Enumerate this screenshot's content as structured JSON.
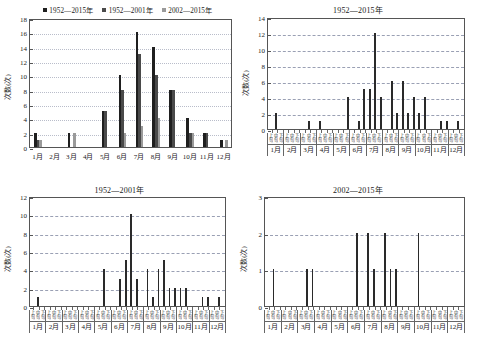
{
  "figure": {
    "ylabel": "次数(次)",
    "legend": [
      {
        "label": "1952—2015年",
        "color": "#1f1f1f"
      },
      {
        "label": "1952—2001年",
        "color": "#4a4a4a"
      },
      {
        "label": "2002—2015年",
        "color": "#9a9a9a"
      }
    ],
    "months": [
      "1月",
      "2月",
      "3月",
      "4月",
      "5月",
      "6月",
      "7月",
      "8月",
      "9月",
      "10月",
      "11月",
      "12月"
    ],
    "dekads": [
      "上旬",
      "中旬",
      "下旬"
    ]
  },
  "chart_data": [
    {
      "type": "bar",
      "panel": "top-left",
      "title": "",
      "xlabel": "",
      "ylabel": "次数(次)",
      "ylim": [
        0,
        18
      ],
      "yticks": [
        0,
        2,
        4,
        6,
        8,
        10,
        12,
        14,
        16,
        18
      ],
      "grid": true,
      "legend_position": "top-center",
      "categories": [
        "1月",
        "2月",
        "3月",
        "4月",
        "5月",
        "6月",
        "7月",
        "8月",
        "9月",
        "10月",
        "11月",
        "12月"
      ],
      "series": [
        {
          "name": "1952—2015年",
          "color": "#1f1f1f",
          "values": [
            2,
            0,
            2,
            0,
            5,
            10,
            16,
            14,
            8,
            4,
            2,
            1
          ]
        },
        {
          "name": "1952—2001年",
          "color": "#4a4a4a",
          "values": [
            1,
            0,
            0,
            0,
            5,
            8,
            13,
            10,
            8,
            2,
            2,
            0
          ]
        },
        {
          "name": "2002—2015年",
          "color": "#9a9a9a",
          "values": [
            1,
            0,
            2,
            0,
            0,
            2,
            3,
            4,
            0,
            2,
            0,
            1
          ]
        }
      ]
    },
    {
      "type": "bar",
      "panel": "top-right",
      "title": "1952—2015年",
      "xlabel": "",
      "ylabel": "次数(次)",
      "ylim": [
        0,
        14
      ],
      "yticks": [
        0,
        2,
        4,
        6,
        8,
        10,
        12,
        14
      ],
      "grid": true,
      "x": [
        "1月上旬",
        "1月中旬",
        "1月下旬",
        "2月上旬",
        "2月中旬",
        "2月下旬",
        "3月上旬",
        "3月中旬",
        "3月下旬",
        "4月上旬",
        "4月中旬",
        "4月下旬",
        "5月上旬",
        "5月中旬",
        "5月下旬",
        "6月上旬",
        "6月中旬",
        "6月下旬",
        "7月上旬",
        "7月中旬",
        "7月下旬",
        "8月上旬",
        "8月中旬",
        "8月下旬",
        "9月上旬",
        "9月中旬",
        "9月下旬",
        "10月上旬",
        "10月中旬",
        "10月下旬",
        "11月上旬",
        "11月中旬",
        "11月下旬",
        "12月上旬",
        "12月中旬",
        "12月下旬"
      ],
      "values": [
        0,
        2,
        0,
        0,
        0,
        0,
        0,
        1,
        0,
        1,
        0,
        0,
        0,
        0,
        4,
        0,
        1,
        5,
        5,
        12,
        4,
        0,
        6,
        2,
        6,
        2,
        4,
        2,
        4,
        0,
        0,
        1,
        1,
        0,
        1,
        0
      ]
    },
    {
      "type": "bar",
      "panel": "bottom-left",
      "title": "1952—2001年",
      "xlabel": "",
      "ylabel": "次数(次)",
      "ylim": [
        0,
        12
      ],
      "yticks": [
        0,
        2,
        4,
        6,
        8,
        10,
        12
      ],
      "grid": true,
      "x": [
        "1月上旬",
        "1月中旬",
        "1月下旬",
        "2月上旬",
        "2月中旬",
        "2月下旬",
        "3月上旬",
        "3月中旬",
        "3月下旬",
        "4月上旬",
        "4月中旬",
        "4月下旬",
        "5月上旬",
        "5月中旬",
        "5月下旬",
        "6月上旬",
        "6月中旬",
        "6月下旬",
        "7月上旬",
        "7月中旬",
        "7月下旬",
        "8月上旬",
        "8月中旬",
        "8月下旬",
        "9月上旬",
        "9月中旬",
        "9月下旬",
        "10月上旬",
        "10月中旬",
        "10月下旬",
        "11月上旬",
        "11月中旬",
        "11月下旬",
        "12月上旬",
        "12月中旬",
        "12月下旬"
      ],
      "values": [
        0,
        1,
        0,
        0,
        0,
        0,
        0,
        0,
        0,
        0,
        0,
        0,
        0,
        4,
        0,
        0,
        3,
        5,
        10,
        3,
        0,
        4,
        1,
        4,
        5,
        2,
        2,
        2,
        2,
        0,
        0,
        1,
        1,
        0,
        1,
        0
      ]
    },
    {
      "type": "bar",
      "panel": "bottom-right",
      "title": "2002—2015年",
      "xlabel": "",
      "ylabel": "次数(次)",
      "ylim": [
        0,
        3
      ],
      "yticks": [
        0,
        1,
        2,
        3
      ],
      "grid": true,
      "x": [
        "1月上旬",
        "1月中旬",
        "1月下旬",
        "2月上旬",
        "2月中旬",
        "2月下旬",
        "3月上旬",
        "3月中旬",
        "3月下旬",
        "4月上旬",
        "4月中旬",
        "4月下旬",
        "5月上旬",
        "5月中旬",
        "5月下旬",
        "6月上旬",
        "6月中旬",
        "6月下旬",
        "7月上旬",
        "7月中旬",
        "7月下旬",
        "8月上旬",
        "8月中旬",
        "8月下旬",
        "9月上旬",
        "9月中旬",
        "9月下旬",
        "10月上旬",
        "10月中旬",
        "10月下旬",
        "11月上旬",
        "11月中旬",
        "11月下旬",
        "12月上旬",
        "12月中旬",
        "12月下旬"
      ],
      "values": [
        0,
        1,
        0,
        0,
        0,
        0,
        0,
        1,
        1,
        0,
        0,
        0,
        0,
        0,
        0,
        0,
        2,
        0,
        2,
        1,
        0,
        2,
        1,
        1,
        0,
        0,
        0,
        2,
        0,
        0,
        0,
        0,
        0,
        0,
        0,
        0
      ]
    }
  ]
}
